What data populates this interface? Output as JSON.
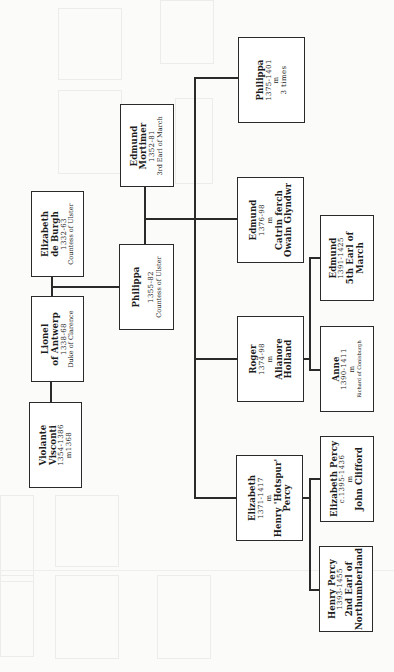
{
  "diagram": {
    "type": "family-tree",
    "orientation": "rotated-90-ccw",
    "line_color": "#2a2a2a",
    "background": "#fbfbfa",
    "people": {
      "violante": {
        "lines": [
          "Violante",
          "Visconti",
          "1354-1386",
          "m1368"
        ]
      },
      "lionel": {
        "lines": [
          "Lionel",
          "of Antwerp",
          "1338-68",
          "Duke of Clarence"
        ]
      },
      "elizabeth_de_burgh": {
        "lines": [
          "Elizabeth",
          "de Burgh",
          "1332-63",
          "Countess of Ulster"
        ]
      },
      "philippa_ulster": {
        "lines": [
          "Philippa",
          "1355-82",
          "Countess of Ulster"
        ]
      },
      "edmund_mortimer": {
        "lines": [
          "Edmund",
          "Mortimer",
          "1352-81",
          "3rd Earl of March"
        ]
      },
      "philippa_1375": {
        "lines": [
          "Philippa",
          "1375-1401",
          "m",
          "3 times"
        ]
      },
      "edmund_1376": {
        "lines": [
          "Edmund",
          "1376-98",
          "m",
          "Catrin ferch",
          "Owain Glyndwr"
        ]
      },
      "roger": {
        "lines": [
          "Roger",
          "1374-98",
          "m",
          "Alianore",
          "Holland"
        ]
      },
      "edmund_1391": {
        "lines": [
          "Edmund",
          "1391-1425",
          "5th Earl of",
          "March"
        ]
      },
      "anne": {
        "lines": [
          "Anne",
          "1390-1411",
          "m",
          "Richard of Conisburgh"
        ]
      },
      "elizabeth_1371": {
        "lines": [
          "Elizabeth",
          "1371-1417",
          "m",
          "Henry 'Hotspur'",
          "Percy"
        ]
      },
      "elizabeth_percy": {
        "lines": [
          "Elizabeth Percy",
          "c.1395-1436",
          "m",
          "John Clifford"
        ]
      },
      "henry_percy": {
        "lines": [
          "Henry Percy",
          "1393-1455",
          "2nd Earl of",
          "Northumberland"
        ]
      }
    },
    "relations": [
      {
        "type": "marriage",
        "a": "lionel",
        "b": "violante"
      },
      {
        "type": "marriage",
        "a": "lionel",
        "b": "elizabeth_de_burgh"
      },
      {
        "type": "parent",
        "parents": [
          "lionel",
          "elizabeth_de_burgh"
        ],
        "child": "philippa_ulster"
      },
      {
        "type": "marriage",
        "a": "philippa_ulster",
        "b": "edmund_mortimer"
      },
      {
        "type": "parent",
        "parents": [
          "philippa_ulster",
          "edmund_mortimer"
        ],
        "children": [
          "philippa_1375",
          "edmund_1376",
          "roger",
          "elizabeth_1371"
        ]
      },
      {
        "type": "parent",
        "parents": [
          "roger"
        ],
        "children": [
          "edmund_1391",
          "anne"
        ]
      },
      {
        "type": "parent",
        "parents": [
          "elizabeth_1371"
        ],
        "children": [
          "elizabeth_percy",
          "henry_percy"
        ]
      }
    ]
  }
}
